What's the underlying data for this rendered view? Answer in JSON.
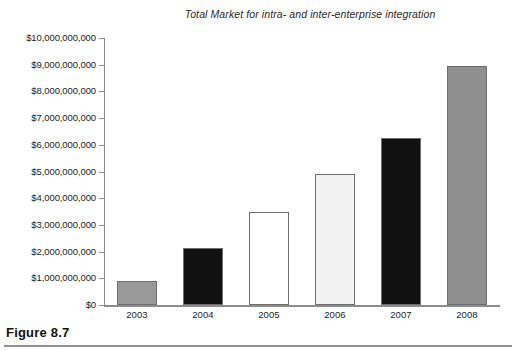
{
  "chart_data": {
    "type": "bar",
    "title": "Total Market for intra- and inter-enterprise integration",
    "xlabel": "",
    "ylabel": "",
    "categories": [
      "2003",
      "2004",
      "2005",
      "2006",
      "2007",
      "2008"
    ],
    "values": [
      900000000,
      2150000000,
      3500000000,
      4900000000,
      6250000000,
      8950000000
    ],
    "ylim": [
      0,
      10000000000
    ],
    "ytick_values": [
      0,
      1000000000,
      2000000000,
      3000000000,
      4000000000,
      5000000000,
      6000000000,
      7000000000,
      8000000000,
      9000000000,
      10000000000
    ],
    "ytick_labels": [
      "$0",
      "$1,000,000,000",
      "$2,000,000,000",
      "$3,000,000,000",
      "$4,000,000,000",
      "$5,000,000,000",
      "$6,000,000,000",
      "$7,000,000,000",
      "$8,000,000,000",
      "$9,000,000,000",
      "$10,000,000,000"
    ],
    "bar_colors": [
      "#9a9a9a",
      "#111111",
      "#ffffff",
      "#f2f2f2",
      "#111111",
      "#8f8f8f"
    ],
    "bar_edge_color": "#6e6e6e",
    "grid": false,
    "legend": null
  },
  "caption": {
    "label": "Figure 8.7"
  }
}
